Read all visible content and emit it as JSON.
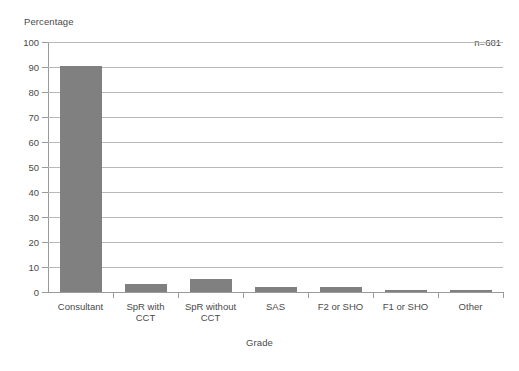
{
  "chart_data": {
    "type": "bar",
    "title": "",
    "xlabel": "Grade",
    "ylabel": "Percentage",
    "categories": [
      "Consultant",
      "SpR with\nCCT",
      "SpR without\nCCT",
      "SAS",
      "F2 or SHO",
      "F1 or SHO",
      "Other"
    ],
    "values": [
      90.5,
      3.3,
      5.2,
      2.0,
      2.0,
      1.0,
      1.0
    ],
    "ylim": [
      0,
      100
    ],
    "ytick_values": [
      0,
      10,
      20,
      30,
      40,
      50,
      60,
      70,
      80,
      90,
      100
    ],
    "ytick_labels": [
      "0",
      "10",
      "20",
      "30",
      "40",
      "50",
      "60",
      "70",
      "80",
      "90",
      "100"
    ],
    "grid": true,
    "legend": false,
    "annotations": [
      {
        "text": "n=681",
        "position": "top-right"
      }
    ],
    "bar_color": "#808080",
    "gridline_color": "#b8b8b8",
    "axis_color": "#9a9a9a",
    "background_color": "#ffffff"
  }
}
